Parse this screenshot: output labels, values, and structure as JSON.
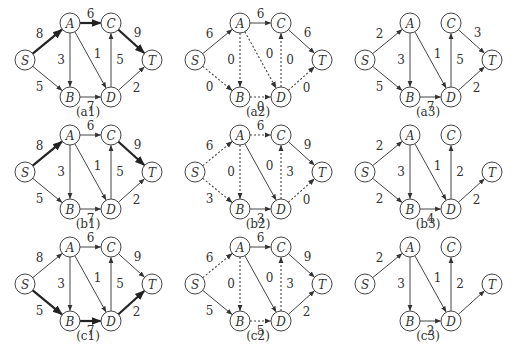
{
  "figure": {
    "node_positions": {
      "S": [
        25,
        55
      ],
      "A": [
        70,
        18
      ],
      "C": [
        111,
        18
      ],
      "T": [
        152,
        55
      ],
      "B": [
        70,
        92
      ],
      "D": [
        111,
        92
      ]
    },
    "node_radius": 10,
    "panels": [
      {
        "id": "a1",
        "caption": "(a1)",
        "origin": [
          0,
          5
        ],
        "nodes": [
          "S",
          "A",
          "B",
          "C",
          "D",
          "T"
        ],
        "edges": [
          {
            "from": "S",
            "to": "A",
            "label": "8",
            "style": "bold",
            "lpos": [
              -8,
              -8
            ]
          },
          {
            "from": "S",
            "to": "B",
            "label": "5",
            "style": "solid",
            "lpos": [
              -8,
              8
            ]
          },
          {
            "from": "A",
            "to": "C",
            "label": "6",
            "style": "bold",
            "lpos": [
              0,
              -9
            ]
          },
          {
            "from": "A",
            "to": "B",
            "label": "3",
            "style": "solid",
            "lpos": [
              -9,
              0
            ]
          },
          {
            "from": "A",
            "to": "D",
            "label": "1",
            "style": "solid",
            "lpos": [
              7,
              -6
            ]
          },
          {
            "from": "B",
            "to": "D",
            "label": "7",
            "style": "solid",
            "lpos": [
              0,
              10
            ]
          },
          {
            "from": "D",
            "to": "C",
            "label": "5",
            "style": "solid",
            "lpos": [
              9,
              0
            ]
          },
          {
            "from": "C",
            "to": "T",
            "label": "9",
            "style": "bold",
            "lpos": [
              6,
              -9
            ]
          },
          {
            "from": "D",
            "to": "T",
            "label": "2",
            "style": "solid",
            "lpos": [
              5,
              9
            ]
          }
        ]
      },
      {
        "id": "a2",
        "caption": "(a2)",
        "origin": [
          170,
          5
        ],
        "nodes": [
          "S",
          "A",
          "B",
          "C",
          "D",
          "T"
        ],
        "edges": [
          {
            "from": "S",
            "to": "A",
            "label": "6",
            "style": "solid",
            "lpos": [
              -8,
              -8
            ]
          },
          {
            "from": "S",
            "to": "B",
            "label": "0",
            "style": "dashed",
            "lpos": [
              -8,
              8
            ]
          },
          {
            "from": "A",
            "to": "C",
            "label": "6",
            "style": "solid",
            "lpos": [
              0,
              -9
            ]
          },
          {
            "from": "A",
            "to": "B",
            "label": "0",
            "style": "dashed",
            "lpos": [
              -9,
              0
            ]
          },
          {
            "from": "A",
            "to": "D",
            "label": "0",
            "style": "dashed",
            "lpos": [
              9,
              -6
            ]
          },
          {
            "from": "B",
            "to": "D",
            "label": "0",
            "style": "dashed",
            "lpos": [
              0,
              10
            ]
          },
          {
            "from": "D",
            "to": "C",
            "label": "0",
            "style": "dashed",
            "lpos": [
              9,
              0
            ]
          },
          {
            "from": "C",
            "to": "T",
            "label": "6",
            "style": "solid",
            "lpos": [
              6,
              -9
            ]
          },
          {
            "from": "D",
            "to": "T",
            "label": "0",
            "style": "dashed",
            "lpos": [
              5,
              9
            ]
          }
        ]
      },
      {
        "id": "a3",
        "caption": "(a3)",
        "origin": [
          340,
          5
        ],
        "nodes": [
          "S",
          "A",
          "B",
          "C",
          "D",
          "T"
        ],
        "edges": [
          {
            "from": "S",
            "to": "A",
            "label": "2",
            "style": "solid",
            "lpos": [
              -8,
              -8
            ]
          },
          {
            "from": "S",
            "to": "B",
            "label": "5",
            "style": "solid",
            "lpos": [
              -8,
              8
            ]
          },
          {
            "from": "A",
            "to": "B",
            "label": "3",
            "style": "solid",
            "lpos": [
              -9,
              0
            ]
          },
          {
            "from": "A",
            "to": "D",
            "label": "1",
            "style": "solid",
            "lpos": [
              7,
              -6
            ]
          },
          {
            "from": "B",
            "to": "D",
            "label": "7",
            "style": "solid",
            "lpos": [
              0,
              10
            ]
          },
          {
            "from": "D",
            "to": "C",
            "label": "5",
            "style": "solid",
            "lpos": [
              9,
              0
            ]
          },
          {
            "from": "C",
            "to": "T",
            "label": "3",
            "style": "solid",
            "lpos": [
              6,
              -9
            ]
          },
          {
            "from": "D",
            "to": "T",
            "label": "2",
            "style": "solid",
            "lpos": [
              5,
              9
            ]
          }
        ]
      },
      {
        "id": "b1",
        "caption": "(b1)",
        "origin": [
          0,
          117
        ],
        "nodes": [
          "S",
          "A",
          "B",
          "C",
          "D",
          "T"
        ],
        "edges": [
          {
            "from": "S",
            "to": "A",
            "label": "8",
            "style": "bold",
            "lpos": [
              -8,
              -8
            ]
          },
          {
            "from": "S",
            "to": "B",
            "label": "5",
            "style": "solid",
            "lpos": [
              -8,
              8
            ]
          },
          {
            "from": "A",
            "to": "C",
            "label": "6",
            "style": "solid",
            "lpos": [
              0,
              -9
            ]
          },
          {
            "from": "A",
            "to": "B",
            "label": "3",
            "style": "solid",
            "lpos": [
              -9,
              0
            ]
          },
          {
            "from": "A",
            "to": "D",
            "label": "1",
            "style": "solid",
            "lpos": [
              7,
              -6
            ]
          },
          {
            "from": "B",
            "to": "D",
            "label": "7",
            "style": "solid",
            "lpos": [
              0,
              10
            ]
          },
          {
            "from": "D",
            "to": "C",
            "label": "5",
            "style": "solid",
            "lpos": [
              9,
              0
            ]
          },
          {
            "from": "C",
            "to": "T",
            "label": "9",
            "style": "bold",
            "lpos": [
              6,
              -9
            ]
          },
          {
            "from": "D",
            "to": "T",
            "label": "2",
            "style": "solid",
            "lpos": [
              5,
              9
            ]
          }
        ]
      },
      {
        "id": "b2",
        "caption": "(b2)",
        "origin": [
          170,
          117
        ],
        "nodes": [
          "S",
          "A",
          "B",
          "C",
          "D",
          "T"
        ],
        "edges": [
          {
            "from": "S",
            "to": "A",
            "label": "6",
            "style": "dashed",
            "lpos": [
              -8,
              -8
            ]
          },
          {
            "from": "S",
            "to": "B",
            "label": "3",
            "style": "dashed",
            "lpos": [
              -8,
              8
            ]
          },
          {
            "from": "A",
            "to": "C",
            "label": "6",
            "style": "dashed",
            "lpos": [
              0,
              -9
            ]
          },
          {
            "from": "A",
            "to": "B",
            "label": "0",
            "style": "dashed",
            "lpos": [
              -9,
              0
            ]
          },
          {
            "from": "A",
            "to": "D",
            "label": "0",
            "style": "solid",
            "lpos": [
              9,
              -6
            ]
          },
          {
            "from": "B",
            "to": "D",
            "label": "3",
            "style": "solid",
            "lpos": [
              0,
              10
            ]
          },
          {
            "from": "D",
            "to": "C",
            "label": "3",
            "style": "dashed",
            "lpos": [
              9,
              0
            ]
          },
          {
            "from": "C",
            "to": "T",
            "label": "9",
            "style": "solid",
            "lpos": [
              6,
              -9
            ]
          },
          {
            "from": "D",
            "to": "T",
            "label": "0",
            "style": "dashed",
            "lpos": [
              5,
              9
            ]
          }
        ]
      },
      {
        "id": "b3",
        "caption": "(b3)",
        "origin": [
          340,
          117
        ],
        "nodes": [
          "S",
          "A",
          "B",
          "C",
          "D",
          "T"
        ],
        "edges": [
          {
            "from": "S",
            "to": "A",
            "label": "2",
            "style": "solid",
            "lpos": [
              -8,
              -8
            ]
          },
          {
            "from": "S",
            "to": "B",
            "label": "2",
            "style": "solid",
            "lpos": [
              -8,
              8
            ]
          },
          {
            "from": "A",
            "to": "B",
            "label": "3",
            "style": "solid",
            "lpos": [
              -9,
              0
            ]
          },
          {
            "from": "A",
            "to": "D",
            "label": "1",
            "style": "solid",
            "lpos": [
              7,
              -6
            ]
          },
          {
            "from": "B",
            "to": "D",
            "label": "4",
            "style": "solid",
            "lpos": [
              0,
              10
            ]
          },
          {
            "from": "D",
            "to": "C",
            "label": "2",
            "style": "solid",
            "lpos": [
              9,
              0
            ]
          },
          {
            "from": "D",
            "to": "T",
            "label": "2",
            "style": "solid",
            "lpos": [
              5,
              9
            ]
          }
        ]
      },
      {
        "id": "c1",
        "caption": "(c1)",
        "origin": [
          0,
          229
        ],
        "nodes": [
          "S",
          "A",
          "B",
          "C",
          "D",
          "T"
        ],
        "edges": [
          {
            "from": "S",
            "to": "A",
            "label": "8",
            "style": "solid",
            "lpos": [
              -8,
              -8
            ]
          },
          {
            "from": "S",
            "to": "B",
            "label": "5",
            "style": "bold",
            "lpos": [
              -8,
              8
            ]
          },
          {
            "from": "A",
            "to": "C",
            "label": "6",
            "style": "solid",
            "lpos": [
              0,
              -9
            ]
          },
          {
            "from": "A",
            "to": "B",
            "label": "3",
            "style": "solid",
            "lpos": [
              -9,
              0
            ]
          },
          {
            "from": "A",
            "to": "D",
            "label": "1",
            "style": "solid",
            "lpos": [
              7,
              -6
            ]
          },
          {
            "from": "B",
            "to": "D",
            "label": "7",
            "style": "bold",
            "lpos": [
              0,
              10
            ]
          },
          {
            "from": "D",
            "to": "C",
            "label": "5",
            "style": "solid",
            "lpos": [
              9,
              0
            ]
          },
          {
            "from": "C",
            "to": "T",
            "label": "9",
            "style": "solid",
            "lpos": [
              6,
              -9
            ]
          },
          {
            "from": "D",
            "to": "T",
            "label": "2",
            "style": "bold",
            "lpos": [
              5,
              9
            ]
          }
        ]
      },
      {
        "id": "c2",
        "caption": "(c2)",
        "origin": [
          170,
          229
        ],
        "nodes": [
          "S",
          "A",
          "B",
          "C",
          "D",
          "T"
        ],
        "edges": [
          {
            "from": "S",
            "to": "A",
            "label": "6",
            "style": "dashed",
            "lpos": [
              -8,
              -8
            ]
          },
          {
            "from": "S",
            "to": "B",
            "label": "5",
            "style": "solid",
            "lpos": [
              -8,
              8
            ]
          },
          {
            "from": "A",
            "to": "C",
            "label": "6",
            "style": "solid",
            "lpos": [
              0,
              -9
            ]
          },
          {
            "from": "A",
            "to": "B",
            "label": "0",
            "style": "dashed",
            "lpos": [
              -9,
              0
            ]
          },
          {
            "from": "A",
            "to": "D",
            "label": "0",
            "style": "solid",
            "lpos": [
              9,
              -6
            ]
          },
          {
            "from": "B",
            "to": "D",
            "label": "5",
            "style": "dashed",
            "lpos": [
              0,
              10
            ]
          },
          {
            "from": "D",
            "to": "C",
            "label": "3",
            "style": "dashed",
            "lpos": [
              9,
              0
            ]
          },
          {
            "from": "C",
            "to": "T",
            "label": "9",
            "style": "solid",
            "lpos": [
              6,
              -9
            ]
          },
          {
            "from": "D",
            "to": "T",
            "label": "2",
            "style": "solid",
            "lpos": [
              5,
              9
            ]
          }
        ]
      },
      {
        "id": "c3",
        "caption": "(c3)",
        "origin": [
          340,
          229
        ],
        "nodes": [
          "S",
          "A",
          "B",
          "C",
          "D",
          "T"
        ],
        "edges": [
          {
            "from": "S",
            "to": "A",
            "label": "2",
            "style": "solid",
            "lpos": [
              -8,
              -8
            ]
          },
          {
            "from": "A",
            "to": "B",
            "label": "3",
            "style": "solid",
            "lpos": [
              -9,
              0
            ]
          },
          {
            "from": "A",
            "to": "D",
            "label": "1",
            "style": "solid",
            "lpos": [
              7,
              -6
            ]
          },
          {
            "from": "B",
            "to": "D",
            "label": "2",
            "style": "solid",
            "lpos": [
              0,
              10
            ]
          },
          {
            "from": "D",
            "to": "C",
            "label": "2",
            "style": "solid",
            "lpos": [
              9,
              0
            ]
          },
          {
            "from": "D",
            "to": "T",
            "label": "",
            "style": "solid",
            "lpos": [
              5,
              9
            ]
          }
        ]
      }
    ]
  },
  "colors": {
    "background": "#ffffff",
    "stroke": "#444444",
    "bold_stroke": "#222222",
    "text": "#333333"
  }
}
